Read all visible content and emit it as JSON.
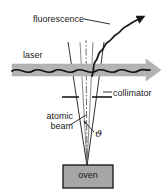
{
  "figure": {
    "background_color": "#ffffff",
    "width": 168,
    "height": 194
  },
  "labels": {
    "fluorescence": "fluorescence",
    "laser": "laser",
    "collimator": "collimator",
    "atomic_beam_line1": "atomic",
    "atomic_beam_line2": "beam",
    "angle_symbol": "ϑ",
    "oven": "oven"
  },
  "colors": {
    "line": "#1a1a1a",
    "text": "#1a1a1a",
    "laser_arrow_fill": "#b3b3b3",
    "laser_arrow_stroke": "#999999",
    "oven_fill": "#a6a6a6",
    "oven_stroke": "#111111",
    "background": "#ffffff"
  },
  "elements": {
    "laser_beam": {
      "name": "laser",
      "description": "horizontal gray arrow with black wavy line, pointing right",
      "y": 70,
      "x_start": 12,
      "x_end": 160
    },
    "fluorescence_arrow": {
      "name": "fluorescence",
      "description": "wavy arrow emitted up and to the right from beam crossing",
      "origin_x": 92,
      "origin_y": 74,
      "tip_x": 146,
      "tip_y": 16
    },
    "collimator": {
      "name": "collimator",
      "description": "two horizontal bars forming a slit across the atomic beam",
      "y": 97,
      "left_bar": [
        62,
        79
      ],
      "right_bar": [
        92,
        110
      ]
    },
    "atomic_beam": {
      "name": "atomic beam",
      "description": "diverging cone of atoms rising from the oven aperture",
      "apex_x": 87,
      "apex_y": 165,
      "top_left_x": 68,
      "top_right_x": 104,
      "top_y": 42,
      "centerline": "dash-dot"
    },
    "divergence_angle": {
      "name": "divergence angle",
      "symbol": "ϑ",
      "leader_from": [
        95,
        132
      ],
      "leader_to": [
        84,
        122
      ]
    },
    "oven": {
      "name": "oven",
      "description": "gray rectangle source at the bottom",
      "x": 63,
      "y": 165,
      "width": 50,
      "height": 23
    }
  }
}
